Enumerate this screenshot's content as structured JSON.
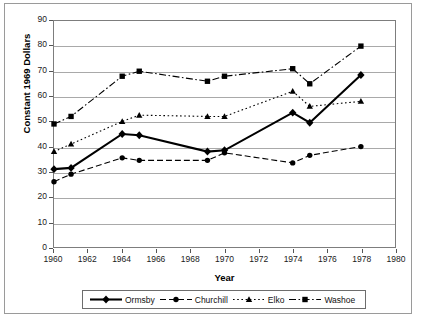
{
  "chart_data": {
    "type": "line",
    "title": "",
    "xlabel": "Year",
    "ylabel": "Constant 1969 Dollars",
    "xlim": [
      1960,
      1980
    ],
    "ylim": [
      0,
      90
    ],
    "xticks": [
      1960,
      1962,
      1964,
      1966,
      1968,
      1970,
      1972,
      1974,
      1976,
      1978,
      1980
    ],
    "yticks": [
      0,
      10,
      20,
      30,
      40,
      50,
      60,
      70,
      80,
      90
    ],
    "grid": "horizontal",
    "legend_position": "bottom",
    "x": [
      1960,
      1961,
      1964,
      1965,
      1969,
      1970,
      1974,
      1975,
      1978
    ],
    "series": [
      {
        "name": "Ormsby",
        "marker": "diamond",
        "linestyle": "solid",
        "color": "#000000",
        "values": [
          31,
          31.5,
          45,
          44.5,
          38,
          38.5,
          53.5,
          49.5,
          68.5
        ]
      },
      {
        "name": "Churchill",
        "marker": "circle",
        "linestyle": "dashed",
        "color": "#000000",
        "values": [
          26,
          29,
          35.5,
          34.5,
          34.5,
          37.5,
          33.5,
          36.5,
          40
        ]
      },
      {
        "name": "Elko",
        "marker": "triangle",
        "linestyle": "dotted",
        "color": "#000000",
        "values": [
          38,
          41,
          50,
          52.5,
          52,
          52,
          62,
          56,
          58
        ]
      },
      {
        "name": "Washoe",
        "marker": "square",
        "linestyle": "dashdot",
        "color": "#000000",
        "values": [
          49,
          52,
          68,
          70,
          66,
          68,
          71,
          65,
          80
        ]
      }
    ]
  },
  "axes": {
    "y_title": "Constant 1969 Dollars",
    "x_title": "Year",
    "y_tick_labels": [
      "90",
      "80",
      "70",
      "60",
      "50",
      "40",
      "30",
      "20",
      "10",
      "0"
    ],
    "x_tick_labels": [
      "1960",
      "1962",
      "1964",
      "1966",
      "1968",
      "1970",
      "1972",
      "1974",
      "1976",
      "1978",
      "1980"
    ]
  },
  "legend": {
    "items": [
      {
        "label": "Ormsby"
      },
      {
        "label": "Churchill"
      },
      {
        "label": "Elko"
      },
      {
        "label": "Washoe"
      }
    ]
  }
}
